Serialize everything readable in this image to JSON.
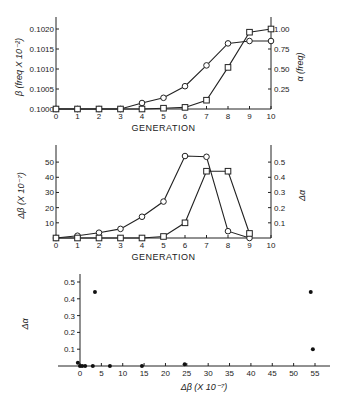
{
  "chart_data": [
    {
      "type": "line",
      "title": "",
      "xlabel": "GENERATION",
      "ylabel_left": "β (freq X 10⁻²)",
      "ylabel_right": "α (freq)",
      "x": [
        0,
        1,
        2,
        3,
        4,
        5,
        6,
        7,
        8,
        9,
        10
      ],
      "xticks": [
        "0",
        "1",
        "2",
        "3",
        "4",
        "5",
        "6",
        "7",
        "8",
        "9",
        "10"
      ],
      "yticks_left": [
        "0.1000",
        "0.1005",
        "0.1010",
        "0.1015",
        "0.1020"
      ],
      "yticks_right": [
        "0.25",
        "0.50",
        "0.75",
        "1.00"
      ],
      "ylim_left": [
        0.1,
        0.1021
      ],
      "ylim_right": [
        0,
        1.05
      ],
      "series": [
        {
          "name": "β",
          "marker": "circle",
          "axis": "left",
          "values": [
            0.1,
            0.1,
            0.1,
            0.1,
            0.10015,
            0.10028,
            0.10057,
            0.10109,
            0.10164,
            0.1017,
            0.1017
          ]
        },
        {
          "name": "α",
          "marker": "square",
          "axis": "right",
          "values": [
            0,
            0,
            0,
            0,
            0,
            0.01,
            0.02,
            0.11,
            0.52,
            0.96,
            1.0
          ]
        }
      ]
    },
    {
      "type": "line",
      "title": "",
      "xlabel": "GENERATION",
      "ylabel_left": "Δβ (X 10⁻⁷)",
      "ylabel_right": "Δα",
      "x": [
        0,
        1,
        2,
        3,
        4,
        5,
        6,
        7,
        8,
        9
      ],
      "xticks": [
        "0",
        "1",
        "2",
        "3",
        "4",
        "5",
        "6",
        "7",
        "8",
        "9",
        "10"
      ],
      "yticks_left": [
        "10",
        "20",
        "30",
        "40",
        "50"
      ],
      "yticks_right": [
        "0.1",
        "0.2",
        "0.3",
        "0.4",
        "0.5"
      ],
      "ylim_left": [
        0,
        56
      ],
      "ylim_right": [
        0,
        0.56
      ],
      "series": [
        {
          "name": "Δβ",
          "marker": "circle",
          "axis": "left",
          "values": [
            0,
            1.5,
            3.5,
            6,
            14,
            24,
            54,
            53.5,
            4.5,
            0
          ]
        },
        {
          "name": "Δα",
          "marker": "square",
          "axis": "right",
          "values": [
            0,
            0,
            0,
            0,
            0,
            0.01,
            0.1,
            0.44,
            0.44,
            0.03
          ]
        }
      ]
    },
    {
      "type": "scatter",
      "title": "",
      "xlabel": "Δβ (X 10⁻⁷)",
      "ylabel": "Δα",
      "xticks": [
        "0",
        "5",
        "10",
        "15",
        "20",
        "25",
        "30",
        "35",
        "40",
        "45",
        "50",
        "55"
      ],
      "yticks": [
        "0.1",
        "0.2",
        "0.3",
        "0.4",
        "0.5"
      ],
      "xlim": [
        -5,
        57
      ],
      "ylim": [
        0,
        0.55
      ],
      "points": [
        {
          "x": -0.5,
          "y": 0.02
        },
        {
          "x": 0,
          "y": 0
        },
        {
          "x": 0.5,
          "y": 0
        },
        {
          "x": 1.2,
          "y": 0
        },
        {
          "x": 3,
          "y": 0
        },
        {
          "x": 3.5,
          "y": 0.44
        },
        {
          "x": 7,
          "y": 0
        },
        {
          "x": 14.5,
          "y": 0
        },
        {
          "x": 24.5,
          "y": 0.01
        },
        {
          "x": 54,
          "y": 0.44
        },
        {
          "x": 54.5,
          "y": 0.1
        }
      ]
    }
  ]
}
